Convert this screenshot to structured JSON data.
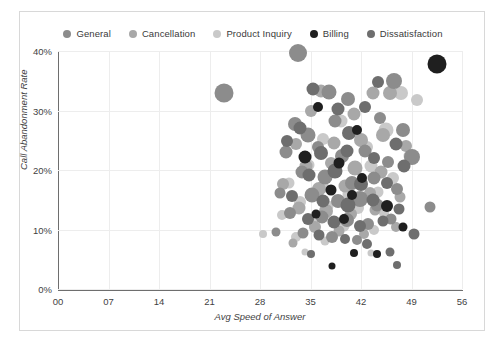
{
  "chart_data": {
    "type": "scatter",
    "title": "",
    "xlabel": "Avg Speed of Answer",
    "ylabel": "Call Abandonment Rate",
    "xlim": [
      0,
      56
    ],
    "ylim": [
      0,
      0.4
    ],
    "xticks": [
      "00",
      "07",
      "14",
      "21",
      "28",
      "35",
      "42",
      "49",
      "56"
    ],
    "xtick_values": [
      0,
      7,
      14,
      21,
      28,
      35,
      42,
      49,
      56
    ],
    "yticks": [
      "0%",
      "10%",
      "20%",
      "30%",
      "40%"
    ],
    "ytick_values": [
      0,
      0.1,
      0.2,
      0.3,
      0.4
    ],
    "grid": true,
    "legend_position": "top",
    "size_encoding": "bubble area",
    "series": [
      {
        "name": "General",
        "color": "#8c8c8c",
        "points": [
          {
            "x": 23.0,
            "y": 0.33,
            "r": 9.5
          },
          {
            "x": 33.2,
            "y": 0.396,
            "r": 9.0
          },
          {
            "x": 37.6,
            "y": 0.331,
            "r": 7.5
          },
          {
            "x": 40.2,
            "y": 0.32,
            "r": 7.0
          },
          {
            "x": 46.6,
            "y": 0.35,
            "r": 8.0
          },
          {
            "x": 32.8,
            "y": 0.277,
            "r": 7.0
          },
          {
            "x": 34.6,
            "y": 0.258,
            "r": 7.5
          },
          {
            "x": 38.4,
            "y": 0.283,
            "r": 6.5
          },
          {
            "x": 44.7,
            "y": 0.288,
            "r": 6.0
          },
          {
            "x": 47.8,
            "y": 0.268,
            "r": 7.0
          },
          {
            "x": 31.6,
            "y": 0.231,
            "r": 6.5
          },
          {
            "x": 36.0,
            "y": 0.238,
            "r": 6.0
          },
          {
            "x": 39.4,
            "y": 0.223,
            "r": 7.0
          },
          {
            "x": 42.6,
            "y": 0.232,
            "r": 6.5
          },
          {
            "x": 45.8,
            "y": 0.213,
            "r": 6.0
          },
          {
            "x": 49.0,
            "y": 0.222,
            "r": 8.0
          },
          {
            "x": 33.8,
            "y": 0.196,
            "r": 6.5
          },
          {
            "x": 37.0,
            "y": 0.188,
            "r": 7.5
          },
          {
            "x": 40.8,
            "y": 0.178,
            "r": 7.0
          },
          {
            "x": 43.8,
            "y": 0.186,
            "r": 6.5
          },
          {
            "x": 47.0,
            "y": 0.168,
            "r": 6.0
          },
          {
            "x": 30.8,
            "y": 0.162,
            "r": 5.5
          },
          {
            "x": 35.2,
            "y": 0.158,
            "r": 7.5
          },
          {
            "x": 38.8,
            "y": 0.148,
            "r": 7.0
          },
          {
            "x": 41.8,
            "y": 0.152,
            "r": 8.0
          },
          {
            "x": 44.2,
            "y": 0.141,
            "r": 6.5
          },
          {
            "x": 32.2,
            "y": 0.128,
            "r": 6.0
          },
          {
            "x": 36.6,
            "y": 0.121,
            "r": 6.5
          },
          {
            "x": 40.0,
            "y": 0.116,
            "r": 7.0
          },
          {
            "x": 43.0,
            "y": 0.109,
            "r": 6.0
          },
          {
            "x": 46.2,
            "y": 0.118,
            "r": 5.5
          },
          {
            "x": 51.6,
            "y": 0.138,
            "r": 5.5
          },
          {
            "x": 34.0,
            "y": 0.094,
            "r": 5.5
          },
          {
            "x": 38.0,
            "y": 0.088,
            "r": 6.0
          },
          {
            "x": 41.4,
            "y": 0.082,
            "r": 5.0
          },
          {
            "x": 30.2,
            "y": 0.095,
            "r": 4.5
          }
        ]
      },
      {
        "name": "Cancellation",
        "color": "#a8a8a8",
        "points": [
          {
            "x": 36.4,
            "y": 0.332,
            "r": 6.5
          },
          {
            "x": 43.6,
            "y": 0.329,
            "r": 6.5
          },
          {
            "x": 46.0,
            "y": 0.33,
            "r": 7.0
          },
          {
            "x": 35.0,
            "y": 0.3,
            "r": 6.0
          },
          {
            "x": 41.0,
            "y": 0.294,
            "r": 6.5
          },
          {
            "x": 45.0,
            "y": 0.258,
            "r": 7.0
          },
          {
            "x": 33.0,
            "y": 0.243,
            "r": 6.0
          },
          {
            "x": 38.2,
            "y": 0.246,
            "r": 6.5
          },
          {
            "x": 42.0,
            "y": 0.25,
            "r": 7.0
          },
          {
            "x": 48.2,
            "y": 0.24,
            "r": 6.0
          },
          {
            "x": 34.4,
            "y": 0.206,
            "r": 6.5
          },
          {
            "x": 37.8,
            "y": 0.212,
            "r": 6.0
          },
          {
            "x": 41.2,
            "y": 0.203,
            "r": 7.5
          },
          {
            "x": 44.8,
            "y": 0.196,
            "r": 6.5
          },
          {
            "x": 31.2,
            "y": 0.176,
            "r": 6.0
          },
          {
            "x": 36.2,
            "y": 0.168,
            "r": 7.0
          },
          {
            "x": 39.8,
            "y": 0.173,
            "r": 6.5
          },
          {
            "x": 43.2,
            "y": 0.162,
            "r": 6.0
          },
          {
            "x": 47.4,
            "y": 0.155,
            "r": 5.5
          },
          {
            "x": 33.4,
            "y": 0.136,
            "r": 6.5
          },
          {
            "x": 37.2,
            "y": 0.131,
            "r": 7.0
          },
          {
            "x": 40.6,
            "y": 0.126,
            "r": 6.0
          },
          {
            "x": 44.0,
            "y": 0.132,
            "r": 5.5
          },
          {
            "x": 35.6,
            "y": 0.104,
            "r": 6.0
          },
          {
            "x": 39.0,
            "y": 0.098,
            "r": 5.5
          },
          {
            "x": 42.4,
            "y": 0.093,
            "r": 5.0
          },
          {
            "x": 46.8,
            "y": 0.104,
            "r": 5.0
          },
          {
            "x": 32.6,
            "y": 0.078,
            "r": 4.5
          }
        ]
      },
      {
        "name": "Product Inquiry",
        "color": "#c9c9c9",
        "points": [
          {
            "x": 47.6,
            "y": 0.329,
            "r": 7.0
          },
          {
            "x": 49.8,
            "y": 0.318,
            "r": 6.0
          },
          {
            "x": 39.2,
            "y": 0.283,
            "r": 6.5
          },
          {
            "x": 45.4,
            "y": 0.268,
            "r": 7.5
          },
          {
            "x": 36.8,
            "y": 0.252,
            "r": 6.0
          },
          {
            "x": 42.8,
            "y": 0.238,
            "r": 6.0
          },
          {
            "x": 48.8,
            "y": 0.224,
            "r": 6.5
          },
          {
            "x": 34.8,
            "y": 0.208,
            "r": 5.5
          },
          {
            "x": 38.6,
            "y": 0.196,
            "r": 6.0
          },
          {
            "x": 43.4,
            "y": 0.206,
            "r": 6.5
          },
          {
            "x": 46.4,
            "y": 0.186,
            "r": 6.0
          },
          {
            "x": 32.0,
            "y": 0.178,
            "r": 5.5
          },
          {
            "x": 36.8,
            "y": 0.172,
            "r": 6.0
          },
          {
            "x": 40.4,
            "y": 0.16,
            "r": 6.5
          },
          {
            "x": 44.4,
            "y": 0.163,
            "r": 5.5
          },
          {
            "x": 33.6,
            "y": 0.146,
            "r": 6.0
          },
          {
            "x": 37.4,
            "y": 0.14,
            "r": 5.5
          },
          {
            "x": 41.6,
            "y": 0.136,
            "r": 6.0
          },
          {
            "x": 45.2,
            "y": 0.128,
            "r": 5.0
          },
          {
            "x": 31.0,
            "y": 0.124,
            "r": 5.0
          },
          {
            "x": 35.4,
            "y": 0.112,
            "r": 5.5
          },
          {
            "x": 39.6,
            "y": 0.106,
            "r": 5.5
          },
          {
            "x": 43.8,
            "y": 0.1,
            "r": 5.0
          },
          {
            "x": 33.0,
            "y": 0.088,
            "r": 5.0
          },
          {
            "x": 37.0,
            "y": 0.08,
            "r": 4.5
          },
          {
            "x": 28.4,
            "y": 0.092,
            "r": 4.0
          },
          {
            "x": 34.2,
            "y": 0.062,
            "r": 3.5
          },
          {
            "x": 43.4,
            "y": 0.06,
            "r": 3.5
          }
        ]
      },
      {
        "name": "Billing",
        "color": "#1f1f1f",
        "points": [
          {
            "x": 52.6,
            "y": 0.378,
            "r": 9.5
          },
          {
            "x": 36.0,
            "y": 0.306,
            "r": 5.0
          },
          {
            "x": 41.4,
            "y": 0.268,
            "r": 5.0
          },
          {
            "x": 34.2,
            "y": 0.222,
            "r": 6.5
          },
          {
            "x": 39.0,
            "y": 0.212,
            "r": 5.5
          },
          {
            "x": 42.2,
            "y": 0.186,
            "r": 5.0
          },
          {
            "x": 37.8,
            "y": 0.166,
            "r": 5.5
          },
          {
            "x": 40.8,
            "y": 0.158,
            "r": 5.0
          },
          {
            "x": 45.6,
            "y": 0.14,
            "r": 6.0
          },
          {
            "x": 35.8,
            "y": 0.126,
            "r": 4.5
          },
          {
            "x": 39.6,
            "y": 0.118,
            "r": 5.0
          },
          {
            "x": 47.8,
            "y": 0.104,
            "r": 4.5
          },
          {
            "x": 41.0,
            "y": 0.06,
            "r": 4.0
          },
          {
            "x": 44.2,
            "y": 0.058,
            "r": 4.0
          },
          {
            "x": 38.0,
            "y": 0.038,
            "r": 3.5
          }
        ]
      },
      {
        "name": "Dissatisfaction",
        "color": "#6e6e6e",
        "points": [
          {
            "x": 35.4,
            "y": 0.336,
            "r": 6.5
          },
          {
            "x": 44.4,
            "y": 0.348,
            "r": 6.0
          },
          {
            "x": 38.8,
            "y": 0.302,
            "r": 6.5
          },
          {
            "x": 42.6,
            "y": 0.306,
            "r": 6.0
          },
          {
            "x": 33.6,
            "y": 0.27,
            "r": 6.5
          },
          {
            "x": 40.4,
            "y": 0.262,
            "r": 7.0
          },
          {
            "x": 46.8,
            "y": 0.244,
            "r": 6.5
          },
          {
            "x": 31.8,
            "y": 0.248,
            "r": 6.0
          },
          {
            "x": 36.4,
            "y": 0.228,
            "r": 7.0
          },
          {
            "x": 40.0,
            "y": 0.232,
            "r": 6.5
          },
          {
            "x": 43.8,
            "y": 0.22,
            "r": 6.0
          },
          {
            "x": 48.0,
            "y": 0.206,
            "r": 6.5
          },
          {
            "x": 34.8,
            "y": 0.192,
            "r": 6.5
          },
          {
            "x": 38.4,
            "y": 0.198,
            "r": 7.5
          },
          {
            "x": 42.0,
            "y": 0.176,
            "r": 7.0
          },
          {
            "x": 45.6,
            "y": 0.178,
            "r": 6.0
          },
          {
            "x": 32.4,
            "y": 0.156,
            "r": 6.0
          },
          {
            "x": 36.8,
            "y": 0.148,
            "r": 6.5
          },
          {
            "x": 40.2,
            "y": 0.142,
            "r": 7.5
          },
          {
            "x": 43.6,
            "y": 0.15,
            "r": 6.5
          },
          {
            "x": 47.2,
            "y": 0.134,
            "r": 5.5
          },
          {
            "x": 34.6,
            "y": 0.118,
            "r": 6.0
          },
          {
            "x": 38.2,
            "y": 0.112,
            "r": 6.5
          },
          {
            "x": 41.8,
            "y": 0.106,
            "r": 6.0
          },
          {
            "x": 45.0,
            "y": 0.114,
            "r": 5.5
          },
          {
            "x": 36.2,
            "y": 0.09,
            "r": 5.5
          },
          {
            "x": 39.8,
            "y": 0.084,
            "r": 5.0
          },
          {
            "x": 42.8,
            "y": 0.076,
            "r": 5.0
          },
          {
            "x": 46.0,
            "y": 0.062,
            "r": 4.5
          },
          {
            "x": 49.4,
            "y": 0.092,
            "r": 5.5
          },
          {
            "x": 35.0,
            "y": 0.058,
            "r": 4.0
          },
          {
            "x": 47.0,
            "y": 0.04,
            "r": 4.0
          }
        ]
      }
    ]
  },
  "legend": {
    "items": [
      {
        "label": "General",
        "color": "#8c8c8c"
      },
      {
        "label": "Cancellation",
        "color": "#a8a8a8"
      },
      {
        "label": "Product Inquiry",
        "color": "#c9c9c9"
      },
      {
        "label": "Billing",
        "color": "#1f1f1f"
      },
      {
        "label": "Dissatisfaction",
        "color": "#6e6e6e"
      }
    ]
  }
}
